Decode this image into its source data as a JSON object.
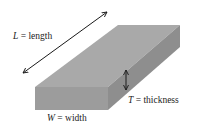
{
  "diagram": {
    "type": "rectangular-slab-dimensions",
    "labels": {
      "length": {
        "var": "L",
        "eq": " = ",
        "text": "length"
      },
      "thickness": {
        "var": "T",
        "eq": " = ",
        "text": "thickness"
      },
      "width": {
        "var": "W",
        "eq": " = ",
        "text": "width"
      }
    },
    "colors": {
      "top_face": "#a9a9a9",
      "front_face": "#9c9c9c",
      "side_face": "#8e8e8e",
      "arrow": "#1a1a1a",
      "text": "#222222"
    }
  }
}
